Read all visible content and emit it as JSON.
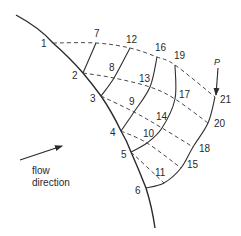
{
  "diagram": {
    "type": "characteristic-mesh",
    "nodes": [
      {
        "id": "1",
        "label": "1"
      },
      {
        "id": "2",
        "label": "2"
      },
      {
        "id": "3",
        "label": "3"
      },
      {
        "id": "4",
        "label": "4"
      },
      {
        "id": "5",
        "label": "5"
      },
      {
        "id": "6",
        "label": "6"
      },
      {
        "id": "7",
        "label": "7"
      },
      {
        "id": "8",
        "label": "8"
      },
      {
        "id": "9",
        "label": "9"
      },
      {
        "id": "10",
        "label": "10"
      },
      {
        "id": "11",
        "label": "11"
      },
      {
        "id": "12",
        "label": "12"
      },
      {
        "id": "13",
        "label": "13"
      },
      {
        "id": "14",
        "label": "14"
      },
      {
        "id": "15",
        "label": "15"
      },
      {
        "id": "16",
        "label": "16"
      },
      {
        "id": "17",
        "label": "17"
      },
      {
        "id": "18",
        "label": "18"
      },
      {
        "id": "19",
        "label": "19"
      },
      {
        "id": "20",
        "label": "20"
      },
      {
        "id": "21",
        "label": "21"
      }
    ],
    "wall_nodes": [
      "1",
      "2",
      "3",
      "4",
      "5",
      "6"
    ],
    "dashed_lines": [
      [
        "1",
        "7",
        "12",
        "16",
        "19",
        "21"
      ],
      [
        "2",
        "8",
        "13",
        "17",
        "20"
      ],
      [
        "3",
        "9",
        "14",
        "18"
      ],
      [
        "4",
        "10",
        "15"
      ],
      [
        "5",
        "11"
      ]
    ],
    "solid_lines": [
      [
        "2",
        "7"
      ],
      [
        "3",
        "8",
        "12"
      ],
      [
        "4",
        "9",
        "13",
        "16"
      ],
      [
        "5",
        "10",
        "14",
        "17",
        "19"
      ],
      [
        "6",
        "11",
        "15",
        "18",
        "20",
        "21"
      ]
    ],
    "point_marker": {
      "label": "P",
      "target": "21"
    },
    "flow_label_line1": "flow",
    "flow_label_line2": "direction"
  }
}
